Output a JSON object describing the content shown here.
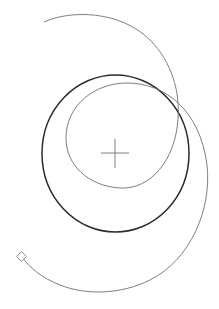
{
  "diagram": {
    "title_cutoff": [
      "",
      ""
    ],
    "colors": {
      "background": "#ffffff",
      "circle_stroke": "#2b2b2b",
      "spiral_stroke": "#707070",
      "crosshair_stroke": "#808080",
      "endpoint_marker_stroke": "#808080"
    },
    "circle": {
      "cx": 115.5,
      "cy": 153.5,
      "rx": 73.5,
      "ry": 78.5
    },
    "crosshair": {
      "cx": 115,
      "cy": 153,
      "half": 14
    },
    "spiral": {
      "start": [
        44,
        22
      ],
      "end": [
        22,
        257
      ]
    },
    "endpoint_marker": {
      "x": 22,
      "y": 257,
      "shape": "diamond"
    }
  }
}
